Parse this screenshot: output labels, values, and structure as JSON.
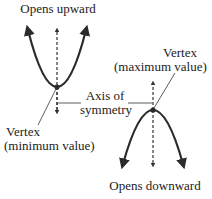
{
  "diagram": {
    "colors": {
      "curve": "#2b2b2b",
      "axis": "#333333",
      "text": "#222222",
      "background": "#ffffff"
    },
    "labels": {
      "opens_upward": "Opens upward",
      "opens_downward": "Opens downward",
      "axis_line1": "Axis of",
      "axis_line2": "symmetry",
      "vertex_min_line1": "Vertex",
      "vertex_min_line2": "(minimum value)",
      "vertex_max_line1": "Vertex",
      "vertex_max_line2": "(maximum value)"
    },
    "parabolas": [
      {
        "name": "upward",
        "vertex": [
          57,
          87
        ],
        "opens": "up"
      },
      {
        "name": "downward",
        "vertex": [
          153,
          110
        ],
        "opens": "down"
      }
    ]
  }
}
